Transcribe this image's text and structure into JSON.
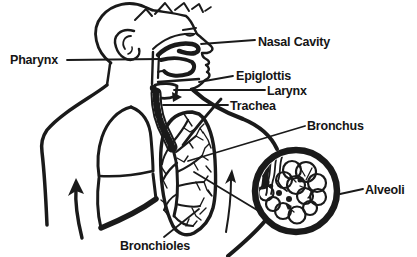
{
  "figure": {
    "background": "#ffffff",
    "ink_color": "#1a1a1a",
    "type": "anatomy-line-diagram",
    "labels": {
      "nasal_cavity": "Nasal Cavity",
      "pharynx": "Pharynx",
      "epiglottis": "Epiglottis",
      "larynx": "Larynx",
      "trachea": "Trachea",
      "bronchus": "Bronchus",
      "alveoli": "Alveoli",
      "bronchioles": "Bronchioles"
    }
  }
}
